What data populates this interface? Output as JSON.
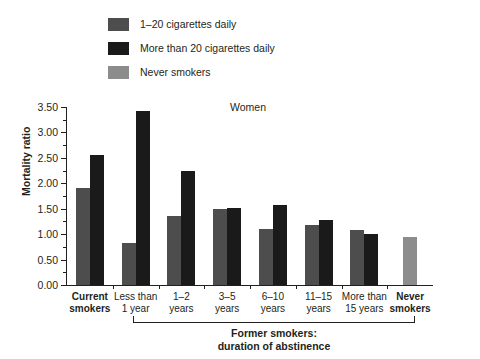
{
  "chart_data": {
    "type": "bar",
    "title": "Women",
    "xlabel": "",
    "ylabel": "Mortality ratio",
    "ylim": [
      0,
      3.5
    ],
    "ytick_step": 0.5,
    "yticks": [
      "0.00",
      "0.50",
      "1.00",
      "1.50",
      "2.00",
      "2.50",
      "3.00",
      "3.50"
    ],
    "grid": false,
    "legend_position": "top-left",
    "categories": [
      "Current smokers",
      "Less than 1 year",
      "1–2 years",
      "3–5 years",
      "6–10 years",
      "11–15 years",
      "More than 15 years",
      "Never smokers"
    ],
    "series": [
      {
        "name": "1–20 cigarettes daily",
        "color": "#4d4d4d",
        "values": [
          1.9,
          0.82,
          1.35,
          1.5,
          1.1,
          1.18,
          1.08,
          null
        ]
      },
      {
        "name": "More than 20 cigarettes daily",
        "color": "#1a1a1a",
        "values": [
          2.55,
          3.43,
          2.25,
          1.52,
          1.57,
          1.27,
          1.0,
          null
        ]
      },
      {
        "name": "Never smokers",
        "color": "#8c8c8c",
        "values": [
          null,
          null,
          null,
          null,
          null,
          null,
          null,
          0.95
        ]
      }
    ],
    "annotations": [
      {
        "text": "Former smokers: duration of abstinence",
        "spans_categories": [
          "Less than 1 year",
          "More than 15 years"
        ]
      }
    ]
  },
  "legend": {
    "items": [
      {
        "label": "1–20 cigarettes daily",
        "color": "#4d4d4d"
      },
      {
        "label": "More than 20 cigarettes daily",
        "color": "#1a1a1a"
      },
      {
        "label": "Never smokers",
        "color": "#8c8c8c"
      }
    ]
  },
  "axes": {
    "y_title": "Mortality ratio",
    "y_labels": [
      "3.50",
      "3.00",
      "2.50",
      "2.00",
      "1.50",
      "1.00",
      "0.50",
      "0.00"
    ]
  },
  "title": "Women",
  "categories_display": [
    {
      "line1": "Current",
      "line2": "smokers",
      "bold": true
    },
    {
      "line1": "Less than",
      "line2": "1 year",
      "bold": false
    },
    {
      "line1": "1–2",
      "line2": "years",
      "bold": false
    },
    {
      "line1": "3–5",
      "line2": "years",
      "bold": false
    },
    {
      "line1": "6–10",
      "line2": "years",
      "bold": false
    },
    {
      "line1": "11–15",
      "line2": "years",
      "bold": false
    },
    {
      "line1": "More than",
      "line2": "15 years",
      "bold": false
    },
    {
      "line1": "Never",
      "line2": "smokers",
      "bold": true
    }
  ],
  "bracket": {
    "line1": "Former smokers:",
    "line2": "duration of abstinence"
  }
}
